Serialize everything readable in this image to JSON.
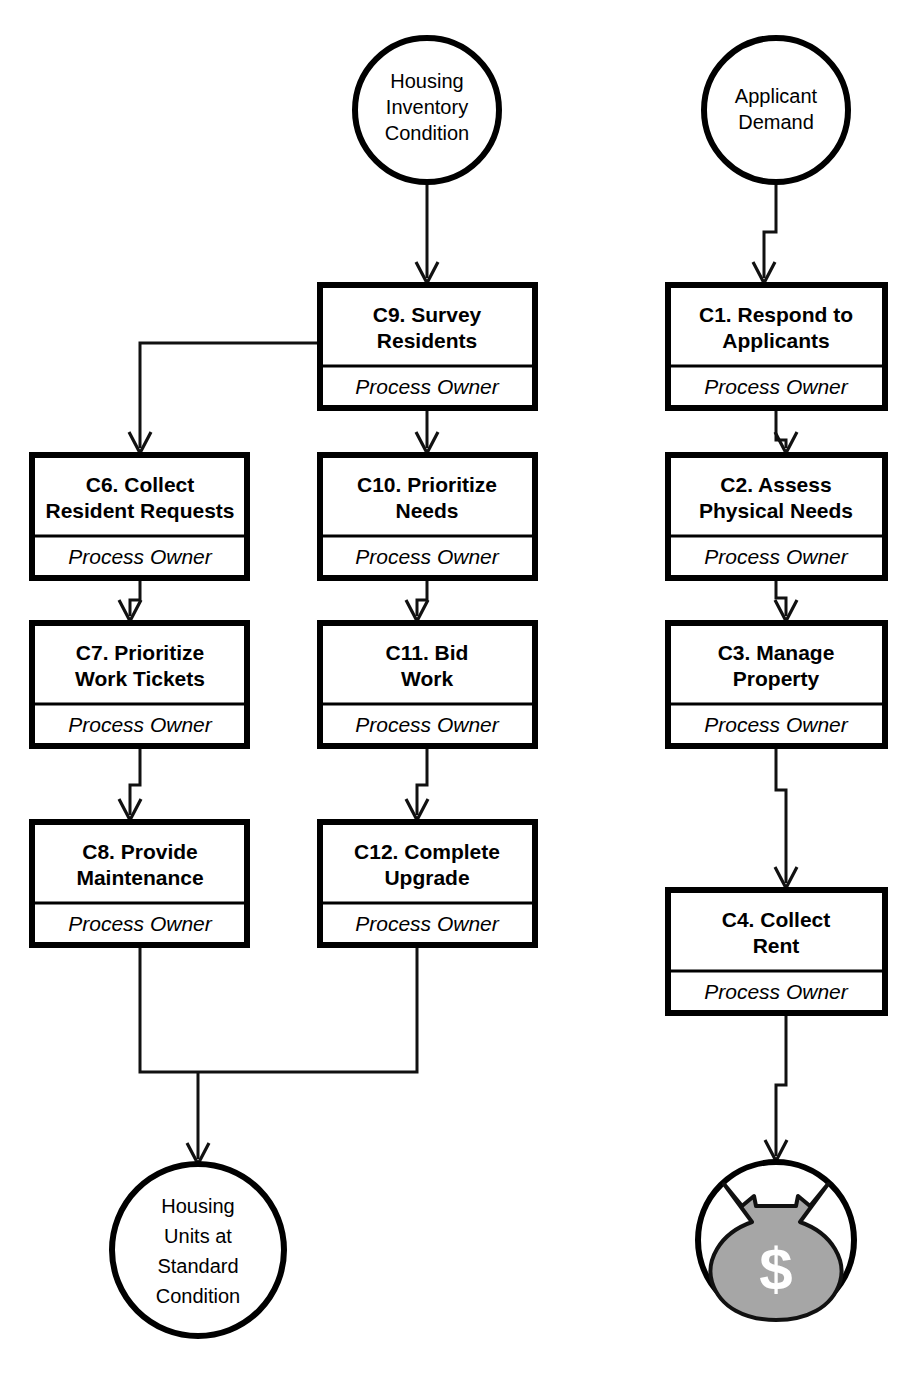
{
  "diagram": {
    "colors": {
      "line": "#111111",
      "box_border": "#000000",
      "box_fill": "#ffffff",
      "background": "#ffffff",
      "money_bag_fill": "#a6a6a6",
      "dollar_glyph": "#ffffff"
    },
    "owner_label": "Process Owner",
    "terminators": [
      {
        "id": "housing-inventory-condition",
        "lines": [
          "Housing",
          "Inventory",
          "Condition"
        ],
        "cx": 427,
        "cy": 110,
        "r": 72,
        "role": "input"
      },
      {
        "id": "applicant-demand",
        "lines": [
          "Applicant",
          "Demand"
        ],
        "cx": 776,
        "cy": 110,
        "r": 72,
        "role": "input"
      },
      {
        "id": "housing-units-standard-condition",
        "lines": [
          "Housing",
          "Units at",
          "Standard",
          "Condition"
        ],
        "cx": 198,
        "cy": 1250,
        "r": 86,
        "role": "output"
      },
      {
        "id": "revenue-money-bag",
        "lines": [],
        "cx": 776,
        "cy": 1240,
        "r": 78,
        "role": "output",
        "icon": "money-bag-icon",
        "symbol": "$"
      }
    ],
    "processes": [
      {
        "id": "c9",
        "title_lines": [
          "C9. Survey",
          "Residents"
        ],
        "owner": "Process Owner",
        "x": 320,
        "y": 285,
        "w": 215,
        "h": 123
      },
      {
        "id": "c1",
        "title_lines": [
          "C1. Respond to",
          "Applicants"
        ],
        "owner": "Process Owner",
        "x": 668,
        "y": 285,
        "w": 217,
        "h": 123
      },
      {
        "id": "c6",
        "title_lines": [
          "C6. Collect",
          "Resident Requests"
        ],
        "owner": "Process Owner",
        "x": 32,
        "y": 455,
        "w": 215,
        "h": 123
      },
      {
        "id": "c10",
        "title_lines": [
          "C10. Prioritize",
          "Needs"
        ],
        "owner": "Process Owner",
        "x": 320,
        "y": 455,
        "w": 215,
        "h": 123
      },
      {
        "id": "c2",
        "title_lines": [
          "C2. Assess",
          "Physical Needs"
        ],
        "owner": "Process Owner",
        "x": 668,
        "y": 455,
        "w": 217,
        "h": 123
      },
      {
        "id": "c7",
        "title_lines": [
          "C7. Prioritize",
          "Work Tickets"
        ],
        "owner": "Process Owner",
        "x": 32,
        "y": 623,
        "w": 215,
        "h": 123
      },
      {
        "id": "c11",
        "title_lines": [
          "C11. Bid",
          "Work"
        ],
        "owner": "Process Owner",
        "x": 320,
        "y": 623,
        "w": 215,
        "h": 123
      },
      {
        "id": "c3",
        "title_lines": [
          "C3. Manage",
          "Property"
        ],
        "owner": "Process Owner",
        "x": 668,
        "y": 623,
        "w": 217,
        "h": 123
      },
      {
        "id": "c8",
        "title_lines": [
          "C8. Provide",
          "Maintenance"
        ],
        "owner": "Process Owner",
        "x": 32,
        "y": 822,
        "w": 215,
        "h": 123
      },
      {
        "id": "c12",
        "title_lines": [
          "C12. Complete",
          "Upgrade"
        ],
        "owner": "Process Owner",
        "x": 320,
        "y": 822,
        "w": 215,
        "h": 123
      },
      {
        "id": "c4",
        "title_lines": [
          "C4. Collect",
          "Rent"
        ],
        "owner": "Process Owner",
        "x": 668,
        "y": 890,
        "w": 217,
        "h": 123
      }
    ],
    "connections": [
      {
        "id": "conn-hic-c9",
        "from": "housing-inventory-condition",
        "to": "c9"
      },
      {
        "id": "conn-ad-c1",
        "from": "applicant-demand",
        "to": "c1"
      },
      {
        "id": "conn-c9-c6",
        "from": "c9",
        "to": "c6"
      },
      {
        "id": "conn-c9-c10",
        "from": "c9",
        "to": "c10"
      },
      {
        "id": "conn-c6-c7",
        "from": "c6",
        "to": "c7"
      },
      {
        "id": "conn-c10-c11",
        "from": "c10",
        "to": "c11"
      },
      {
        "id": "conn-c7-c8",
        "from": "c7",
        "to": "c8"
      },
      {
        "id": "conn-c11-c12",
        "from": "c11",
        "to": "c12"
      },
      {
        "id": "conn-c1-c2",
        "from": "c1",
        "to": "c2"
      },
      {
        "id": "conn-c2-c3",
        "from": "c2",
        "to": "c3"
      },
      {
        "id": "conn-c3-c4",
        "from": "c3",
        "to": "c4"
      },
      {
        "id": "conn-c8-out",
        "from": "c8",
        "to": "housing-units-standard-condition"
      },
      {
        "id": "conn-c12-out",
        "from": "c12",
        "to": "housing-units-standard-condition"
      },
      {
        "id": "conn-c4-money",
        "from": "c4",
        "to": "revenue-money-bag"
      }
    ]
  }
}
